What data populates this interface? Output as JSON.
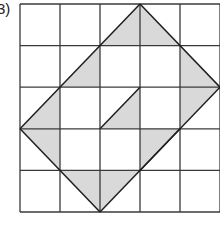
{
  "problem": {
    "label": "3)"
  },
  "grid": {
    "cols": 5,
    "rows": 5,
    "origin_x": 20,
    "origin_y": 4,
    "cell_w": 40,
    "cell_h": 41.6,
    "line_color": "#3a3a3a",
    "fill_color": "#d9d9d9"
  },
  "shaded_triangles": [
    [
      [
        2,
        1
      ],
      [
        3,
        0
      ],
      [
        3,
        1
      ]
    ],
    [
      [
        3,
        0
      ],
      [
        3,
        1
      ],
      [
        4,
        1
      ]
    ],
    [
      [
        1,
        2
      ],
      [
        2,
        1
      ],
      [
        2,
        2
      ]
    ],
    [
      [
        4,
        1
      ],
      [
        4,
        2
      ],
      [
        5,
        2
      ]
    ],
    [
      [
        0,
        3
      ],
      [
        1,
        2
      ],
      [
        1,
        3
      ]
    ],
    [
      [
        2,
        3
      ],
      [
        3,
        2
      ],
      [
        3,
        3
      ]
    ],
    [
      [
        4,
        2
      ],
      [
        5,
        2
      ],
      [
        4,
        3
      ]
    ],
    [
      [
        0,
        3
      ],
      [
        1,
        3
      ],
      [
        1,
        4
      ]
    ],
    [
      [
        3,
        3
      ],
      [
        4,
        3
      ],
      [
        3,
        4
      ]
    ],
    [
      [
        1,
        4
      ],
      [
        2,
        4
      ],
      [
        2,
        5
      ]
    ],
    [
      [
        2,
        4
      ],
      [
        3,
        4
      ],
      [
        2,
        5
      ]
    ]
  ],
  "diagonal_segments": [
    [
      [
        0,
        3
      ],
      [
        3,
        0
      ]
    ],
    [
      [
        3,
        0
      ],
      [
        5,
        2
      ]
    ],
    [
      [
        5,
        2
      ],
      [
        2,
        5
      ]
    ],
    [
      [
        2,
        5
      ],
      [
        0,
        3
      ]
    ],
    [
      [
        2,
        3
      ],
      [
        3,
        2
      ]
    ],
    [
      [
        3,
        4
      ],
      [
        4,
        3
      ]
    ]
  ]
}
